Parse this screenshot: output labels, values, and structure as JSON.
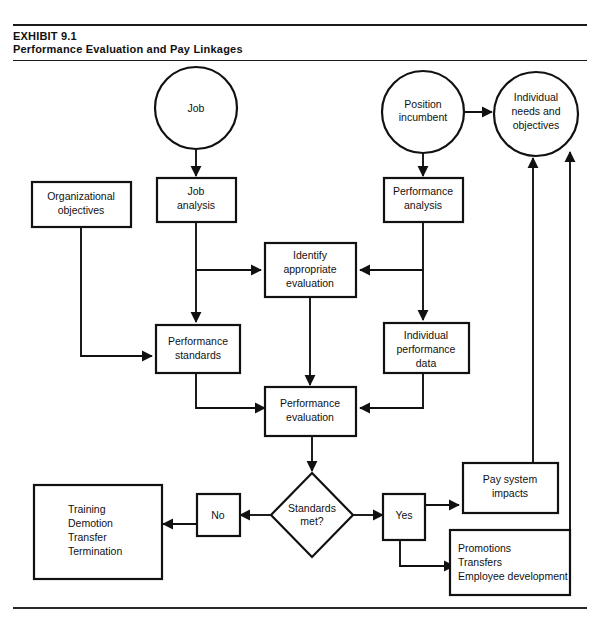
{
  "header": {
    "exhibit_label": "EXHIBIT 9.1",
    "title": "Performance Evaluation and Pay Linkages"
  },
  "colors": {
    "ink": "#111111",
    "background": "#ffffff"
  },
  "nodes": {
    "job": {
      "label": "Job",
      "shape": "circle"
    },
    "position_incumbent": {
      "line1": "Position",
      "line2": "incumbent",
      "shape": "circle"
    },
    "individual_needs": {
      "line1": "Individual",
      "line2": "needs and",
      "line3": "objectives",
      "shape": "circle"
    },
    "organizational_objectives": {
      "line1": "Organizational",
      "line2": "objectives",
      "shape": "rect"
    },
    "job_analysis": {
      "line1": "Job",
      "line2": "analysis",
      "shape": "rect"
    },
    "performance_analysis": {
      "line1": "Performance",
      "line2": "analysis",
      "shape": "rect"
    },
    "identify_evaluation": {
      "line1": "Identify",
      "line2": "appropriate",
      "line3": "evaluation",
      "shape": "rect"
    },
    "performance_standards": {
      "line1": "Performance",
      "line2": "standards",
      "shape": "rect"
    },
    "individual_performance_data": {
      "line1": "Individual",
      "line2": "performance",
      "line3": "data",
      "shape": "rect"
    },
    "performance_evaluation": {
      "line1": "Performance",
      "line2": "evaluation",
      "shape": "rect"
    },
    "standards_met": {
      "line1": "Standards",
      "line2": "met?",
      "shape": "diamond"
    },
    "no_branch": {
      "label": "No",
      "shape": "rect"
    },
    "yes_branch": {
      "label": "Yes",
      "shape": "rect"
    },
    "training_outcomes": {
      "line1": "Training",
      "line2": "Demotion",
      "line3": "Transfer",
      "line4": "Termination",
      "shape": "rect"
    },
    "pay_system_impacts": {
      "line1": "Pay  system",
      "line2": "impacts",
      "shape": "rect"
    },
    "promotions": {
      "line1": "Promotions",
      "line2": "Transfers",
      "line3": "Employee  development",
      "shape": "rect"
    }
  }
}
